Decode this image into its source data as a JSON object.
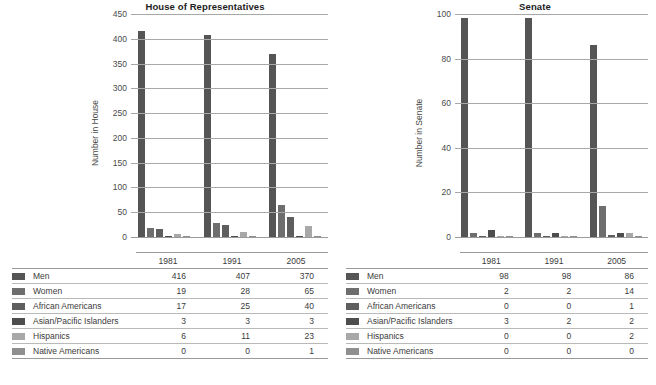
{
  "series_labels": [
    "Men",
    "Women",
    "African Americans",
    "Asian/Pacific Islanders",
    "Hispanics",
    "Native Americans"
  ],
  "series_colors": [
    "#555555",
    "#6e6e6e",
    "#5e5e5e",
    "#4d4d4d",
    "#a8a8a8",
    "#8f8f8f"
  ],
  "house": {
    "title": "House of Representatives",
    "ylabel": "Number in House",
    "yticks": [
      "450",
      "400",
      "350",
      "300",
      "250",
      "200",
      "150",
      "100",
      "50",
      "0"
    ],
    "years": [
      "1981",
      "1991",
      "2005"
    ]
  },
  "senate": {
    "title": "Senate",
    "ylabel": "Number in Senate",
    "yticks": [
      "100",
      "80",
      "60",
      "40",
      "20",
      "0"
    ],
    "years": [
      "1981",
      "1991",
      "2005"
    ]
  },
  "chart_data": [
    {
      "type": "bar",
      "title": "House of Representatives",
      "xlabel": "",
      "ylabel": "Number in House",
      "ylim": [
        0,
        450
      ],
      "ytick_step": 50,
      "grid": true,
      "legend": "table-below",
      "categories": [
        "1981",
        "1991",
        "2005"
      ],
      "series": [
        {
          "name": "Men",
          "values": [
            416,
            407,
            370
          ]
        },
        {
          "name": "Women",
          "values": [
            19,
            28,
            65
          ]
        },
        {
          "name": "African Americans",
          "values": [
            17,
            25,
            40
          ]
        },
        {
          "name": "Asian/Pacific Islanders",
          "values": [
            3,
            3,
            3
          ]
        },
        {
          "name": "Hispanics",
          "values": [
            6,
            11,
            23
          ]
        },
        {
          "name": "Native Americans",
          "values": [
            0,
            0,
            1
          ]
        }
      ]
    },
    {
      "type": "bar",
      "title": "Senate",
      "xlabel": "",
      "ylabel": "Number in Senate",
      "ylim": [
        0,
        100
      ],
      "ytick_step": 20,
      "grid": true,
      "legend": "table-below",
      "categories": [
        "1981",
        "1991",
        "2005"
      ],
      "series": [
        {
          "name": "Men",
          "values": [
            98,
            98,
            86
          ]
        },
        {
          "name": "Women",
          "values": [
            2,
            2,
            14
          ]
        },
        {
          "name": "African Americans",
          "values": [
            0,
            0,
            1
          ]
        },
        {
          "name": "Asian/Pacific Islanders",
          "values": [
            3,
            2,
            2
          ]
        },
        {
          "name": "Hispanics",
          "values": [
            0,
            0,
            2
          ]
        },
        {
          "name": "Native Americans",
          "values": [
            0,
            0,
            0
          ]
        }
      ]
    }
  ]
}
